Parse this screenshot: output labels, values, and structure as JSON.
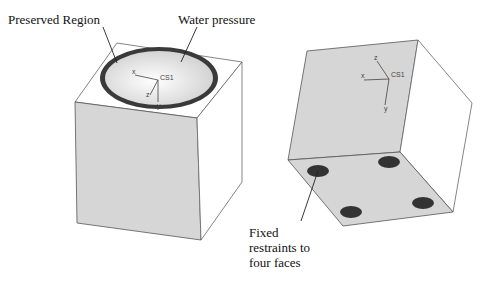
{
  "labels": {
    "preserved_region": "Preserved Region",
    "water_pressure": "Water pressure",
    "fixed_restraints_line1": "Fixed",
    "fixed_restraints_line2": "restraints to",
    "fixed_restraints_line3": "four faces"
  },
  "left_cube": {
    "axes": {
      "origin": "CS1",
      "x": "x",
      "y": "y",
      "z": "z"
    }
  },
  "right_cube": {
    "axes": {
      "origin": "CS1",
      "x": "x",
      "y": "y",
      "z": "z"
    },
    "restraint_count": 4
  },
  "colors": {
    "face_gray": "#d6d6d6",
    "edge": "#555555",
    "ring": "#3a3a3a",
    "restraint": "#333333"
  }
}
